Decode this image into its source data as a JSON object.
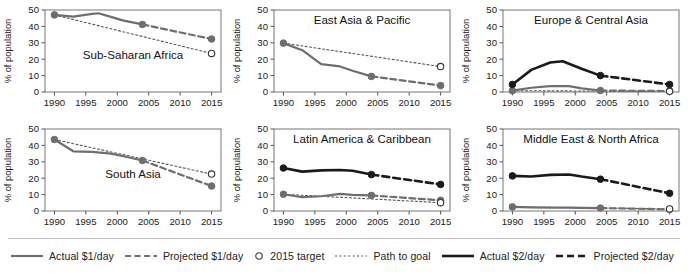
{
  "chart_data": {
    "type": "line",
    "title": "",
    "xlabel": "",
    "ylabel": "% of population",
    "xlim": [
      1988.5,
      2016.5
    ],
    "ylim": [
      0,
      50
    ],
    "yticks": [
      0,
      10,
      20,
      30,
      40,
      50
    ],
    "xticks": [
      1990,
      1995,
      2000,
      2005,
      2010,
      2015
    ],
    "grid": false,
    "legend_position": "bottom",
    "colors": {
      "dollar1": "#6e6e6e",
      "dollar2": "#1a1a1a",
      "path_to_goal": "#555555",
      "target_marker_fill": "#ffffff",
      "axis": "#555555"
    },
    "legend": [
      {
        "label": "Actual $1/day",
        "style": "solid",
        "color": "#6e6e6e",
        "marker": "none"
      },
      {
        "label": "Projected $1/day",
        "style": "dashed",
        "color": "#6e6e6e",
        "marker": "none"
      },
      {
        "label": "2015 target",
        "style": "marker",
        "color": "#1a1a1a",
        "marker": "open-circle"
      },
      {
        "label": "Path to goal",
        "style": "dotted",
        "color": "#555555",
        "marker": "none"
      },
      {
        "label": "Actual $2/day",
        "style": "solid",
        "color": "#1a1a1a",
        "marker": "none"
      },
      {
        "label": "Projected $2/day",
        "style": "dashed",
        "color": "#1a1a1a",
        "marker": "none"
      }
    ],
    "panels": [
      {
        "name": "Sub-Saharan Africa",
        "title_pos": "center-lower",
        "series": [
          {
            "name": "Actual $1/day",
            "kind": "actual",
            "level": "dollar1",
            "x": [
              1990,
              1993,
              1996,
              1997,
              1999,
              2001,
              2004
            ],
            "y": [
              47.0,
              46.0,
              47.6,
              48.0,
              45.8,
              43.5,
              41.2
            ],
            "endpoints": [
              1990,
              2004
            ]
          },
          {
            "name": "Projected $1/day",
            "kind": "projected",
            "level": "dollar1",
            "x": [
              2004,
              2015
            ],
            "y": [
              41.2,
              32.3
            ],
            "endpoints": [
              2015
            ]
          },
          {
            "name": "Path to goal",
            "kind": "path",
            "level": "path",
            "x": [
              1990,
              2015
            ],
            "y": [
              47.0,
              23.5
            ],
            "endpoints": []
          },
          {
            "name": "2015 target",
            "kind": "target",
            "level": "target",
            "x": [
              2015
            ],
            "y": [
              23.5
            ]
          }
        ]
      },
      {
        "name": "East Asia & Pacific",
        "title_pos": "center-upper",
        "series": [
          {
            "name": "Actual $1/day",
            "kind": "actual",
            "level": "dollar1",
            "x": [
              1990,
              1993,
              1996,
              1999,
              2001,
              2004
            ],
            "y": [
              29.8,
              25.5,
              17.0,
              15.6,
              13.0,
              9.5
            ],
            "endpoints": [
              1990,
              2004
            ]
          },
          {
            "name": "Projected $1/day",
            "kind": "projected",
            "level": "dollar1",
            "x": [
              2004,
              2015
            ],
            "y": [
              9.5,
              3.9
            ],
            "endpoints": [
              2015
            ]
          },
          {
            "name": "Path to goal",
            "kind": "path",
            "level": "path",
            "x": [
              1990,
              2015
            ],
            "y": [
              29.8,
              15.5
            ],
            "endpoints": []
          },
          {
            "name": "2015 target",
            "kind": "target",
            "level": "target",
            "x": [
              2015
            ],
            "y": [
              15.5
            ]
          }
        ]
      },
      {
        "name": "Europe & Central Asia",
        "title_pos": "center-upper",
        "series": [
          {
            "name": "Actual $2/day",
            "kind": "actual",
            "level": "dollar2",
            "x": [
              1990,
              1993,
              1996,
              1998,
              2001,
              2004
            ],
            "y": [
              4.6,
              13.5,
              18.0,
              18.8,
              14.2,
              10.0
            ],
            "endpoints": [
              1990,
              2004
            ]
          },
          {
            "name": "Projected $2/day",
            "kind": "projected",
            "level": "dollar2",
            "x": [
              2004,
              2015
            ],
            "y": [
              10.0,
              4.6
            ],
            "endpoints": [
              2015
            ]
          },
          {
            "name": "Actual $1/day",
            "kind": "actual",
            "level": "dollar1",
            "x": [
              1990,
              1993,
              1996,
              1999,
              2001,
              2004
            ],
            "y": [
              0.8,
              2.6,
              3.6,
              3.6,
              2.2,
              0.9
            ],
            "endpoints": [
              1990,
              2004
            ]
          },
          {
            "name": "Projected $1/day",
            "kind": "projected",
            "level": "dollar1",
            "x": [
              2004,
              2015
            ],
            "y": [
              0.9,
              0.6
            ],
            "endpoints": [
              2015
            ]
          },
          {
            "name": "Path to goal",
            "kind": "path",
            "level": "path",
            "x": [
              1990,
              2015
            ],
            "y": [
              0.8,
              0.4
            ],
            "endpoints": []
          },
          {
            "name": "2015 target",
            "kind": "target",
            "level": "target",
            "x": [
              2015
            ],
            "y": [
              0.4
            ]
          }
        ]
      },
      {
        "name": "South Asia",
        "title_pos": "center-lower",
        "series": [
          {
            "name": "Actual $1/day",
            "kind": "actual",
            "level": "dollar1",
            "x": [
              1990,
              1993,
              1996,
              1999,
              2001,
              2004
            ],
            "y": [
              43.6,
              36.4,
              36.0,
              35.0,
              33.4,
              30.8
            ],
            "endpoints": [
              1990,
              2004
            ]
          },
          {
            "name": "Projected $1/day",
            "kind": "projected",
            "level": "dollar1",
            "x": [
              2004,
              2015
            ],
            "y": [
              30.8,
              15.2
            ],
            "endpoints": [
              2015
            ]
          },
          {
            "name": "Path to goal",
            "kind": "path",
            "level": "path",
            "x": [
              1990,
              2015
            ],
            "y": [
              43.6,
              22.5
            ],
            "endpoints": []
          },
          {
            "name": "2015 target",
            "kind": "target",
            "level": "target",
            "x": [
              2015
            ],
            "y": [
              22.5
            ]
          }
        ]
      },
      {
        "name": "Latin America & Caribbean",
        "title_pos": "center-upper",
        "series": [
          {
            "name": "Actual $2/day",
            "kind": "actual",
            "level": "dollar2",
            "x": [
              1990,
              1993,
              1996,
              1999,
              2001,
              2004
            ],
            "y": [
              26.2,
              24.0,
              24.8,
              25.0,
              24.5,
              22.2
            ],
            "endpoints": [
              1990,
              2004
            ]
          },
          {
            "name": "Projected $2/day",
            "kind": "projected",
            "level": "dollar2",
            "x": [
              2004,
              2015
            ],
            "y": [
              22.2,
              16.2
            ],
            "endpoints": [
              2015
            ]
          },
          {
            "name": "Actual $1/day",
            "kind": "actual",
            "level": "dollar1",
            "x": [
              1990,
              1993,
              1996,
              1999,
              2001,
              2004
            ],
            "y": [
              10.2,
              8.4,
              9.0,
              10.4,
              9.8,
              9.5
            ],
            "endpoints": [
              1990,
              2004
            ]
          },
          {
            "name": "Projected $1/day",
            "kind": "projected",
            "level": "dollar1",
            "x": [
              2004,
              2015
            ],
            "y": [
              9.5,
              6.5
            ],
            "endpoints": [
              2015
            ]
          },
          {
            "name": "Path to goal",
            "kind": "path",
            "level": "path",
            "x": [
              1990,
              2015
            ],
            "y": [
              10.2,
              5.1
            ],
            "endpoints": []
          },
          {
            "name": "2015 target",
            "kind": "target",
            "level": "target",
            "x": [
              2015
            ],
            "y": [
              5.1
            ]
          }
        ]
      },
      {
        "name": "Middle East & North Africa",
        "title_pos": "center-upper",
        "series": [
          {
            "name": "Actual $2/day",
            "kind": "actual",
            "level": "dollar2",
            "x": [
              1990,
              1993,
              1996,
              1999,
              2001,
              2004
            ],
            "y": [
              21.4,
              21.0,
              22.0,
              22.3,
              21.0,
              19.4
            ],
            "endpoints": [
              1990,
              2004
            ]
          },
          {
            "name": "Projected $2/day",
            "kind": "projected",
            "level": "dollar2",
            "x": [
              2004,
              2015
            ],
            "y": [
              19.4,
              10.8
            ],
            "endpoints": [
              2015
            ]
          },
          {
            "name": "Actual $1/day",
            "kind": "actual",
            "level": "dollar1",
            "x": [
              1990,
              1993,
              1996,
              1999,
              2001,
              2004
            ],
            "y": [
              2.5,
              2.2,
              2.1,
              2.0,
              1.9,
              1.8
            ],
            "endpoints": [
              1990,
              2004
            ]
          },
          {
            "name": "Projected $1/day",
            "kind": "projected",
            "level": "dollar1",
            "x": [
              2004,
              2015
            ],
            "y": [
              1.8,
              1.0
            ],
            "endpoints": [
              2015
            ]
          },
          {
            "name": "Path to goal",
            "kind": "path",
            "level": "path",
            "x": [
              1990,
              2015
            ],
            "y": [
              2.5,
              1.25
            ],
            "endpoints": []
          },
          {
            "name": "2015 target",
            "kind": "target",
            "level": "target",
            "x": [
              2015
            ],
            "y": [
              1.25
            ]
          }
        ]
      }
    ]
  }
}
